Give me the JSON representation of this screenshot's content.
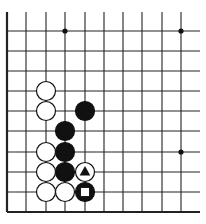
{
  "board": {
    "description": "Partial Go board diagram (lower-left corner region)",
    "columns_x": [
      7,
      26,
      46,
      65,
      85,
      104,
      123,
      142,
      162,
      181
    ],
    "rows_y": [
      31,
      51,
      71,
      91,
      111,
      131,
      152,
      172,
      192,
      212
    ],
    "top_extend_y": 12,
    "right_extend_x": 200,
    "edge_left": true,
    "edge_bottom": true,
    "line_color": "#222222",
    "stone_radius": 9.5,
    "hoshi": [
      {
        "col": 3,
        "row": 0
      },
      {
        "col": 9,
        "row": 0
      },
      {
        "col": 9,
        "row": 6
      }
    ],
    "stones": [
      {
        "color": "white",
        "col": 2,
        "row": 3
      },
      {
        "color": "white",
        "col": 2,
        "row": 4
      },
      {
        "color": "black",
        "col": 4,
        "row": 4
      },
      {
        "color": "black",
        "col": 3,
        "row": 5
      },
      {
        "color": "white",
        "col": 2,
        "row": 6
      },
      {
        "color": "black",
        "col": 3,
        "row": 6
      },
      {
        "color": "white",
        "col": 2,
        "row": 7
      },
      {
        "color": "black",
        "col": 3,
        "row": 7
      },
      {
        "color": "white",
        "col": 4,
        "row": 7,
        "marker": "triangle"
      },
      {
        "color": "white",
        "col": 2,
        "row": 8
      },
      {
        "color": "white",
        "col": 3,
        "row": 8
      },
      {
        "color": "black",
        "col": 4,
        "row": 8,
        "marker": "square"
      }
    ]
  }
}
